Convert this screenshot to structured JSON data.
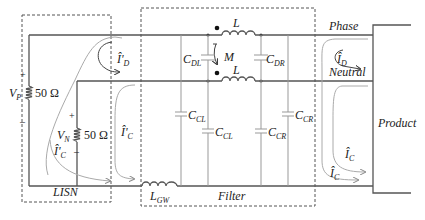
{
  "diagram": {
    "type": "EMI filter circuit with LISN",
    "blocks": {
      "lisn": {
        "label": "LISN"
      },
      "filter": {
        "label": "Filter"
      },
      "product": {
        "label": "Product"
      }
    },
    "lines": {
      "phase": "Phase",
      "neutral": "Neutral"
    },
    "sources": [
      {
        "name": "V",
        "sub": "P",
        "resistor": "50 Ω",
        "plus": "+",
        "minus": "–"
      },
      {
        "name": "V",
        "sub": "N",
        "resistor": "50 Ω",
        "plus": "+",
        "minus": "–"
      }
    ],
    "components": {
      "inductor_top": {
        "name": "L"
      },
      "inductor_bottom": {
        "name": "L"
      },
      "mutual": {
        "name": "M"
      },
      "c_dl": {
        "name": "C",
        "sub": "DL"
      },
      "c_dr": {
        "name": "C",
        "sub": "DR"
      },
      "c_cl_outer": {
        "name": "C",
        "sub": "CL"
      },
      "c_cl_inner": {
        "name": "C",
        "sub": "CL"
      },
      "c_cr_inner": {
        "name": "C",
        "sub": "CR"
      },
      "c_cr_outer": {
        "name": "C",
        "sub": "CR"
      },
      "l_gw": {
        "name": "L",
        "sub": "GW"
      }
    },
    "currents": {
      "lisn_diff": {
        "name": "Î'",
        "sub": "D"
      },
      "lisn_common_1": {
        "name": "Î'",
        "sub": "C"
      },
      "lisn_common_2": {
        "name": "Î'",
        "sub": "C"
      },
      "prod_diff": {
        "name": "Î",
        "sub": "D"
      },
      "prod_common_1": {
        "name": "Î",
        "sub": "C"
      },
      "prod_common_2": {
        "name": "Î",
        "sub": "C"
      }
    }
  }
}
